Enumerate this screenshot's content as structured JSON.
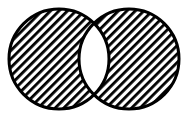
{
  "diagram": {
    "type": "venn",
    "operation": "symmetric-difference",
    "sets": [
      {
        "id": "A",
        "cx": 59,
        "cy": 59,
        "r": 50,
        "shaded": true
      },
      {
        "id": "B",
        "cx": 129,
        "cy": 59,
        "r": 50,
        "shaded": true
      }
    ],
    "intersection": {
      "shaded": false
    },
    "colors": {
      "stroke": "#000000",
      "hatch": "#000000",
      "background": "#ffffff"
    },
    "hatch": {
      "direction": "backslash",
      "spacing": 6,
      "thickness": 2.6
    },
    "stroke_width": 3
  }
}
